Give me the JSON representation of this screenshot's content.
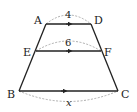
{
  "diagram": {
    "type": "trapezoid-with-parallel-segments",
    "points": {
      "A": {
        "label": "A",
        "x": 46,
        "y": 24
      },
      "D": {
        "label": "D",
        "x": 91,
        "y": 24
      },
      "E": {
        "label": "E",
        "x": 36,
        "y": 51
      },
      "F": {
        "label": "F",
        "x": 101,
        "y": 51
      },
      "B": {
        "label": "B",
        "x": 19,
        "y": 91
      },
      "C": {
        "label": "C",
        "x": 118,
        "y": 91
      }
    },
    "segments": [
      {
        "name": "AD",
        "length_label": "4",
        "arc": "above"
      },
      {
        "name": "EF",
        "length_label": "6",
        "arc": "above"
      },
      {
        "name": "BC",
        "length_label": "x",
        "arc": "below"
      }
    ],
    "parallel_marks": "single arrow on AD, EF, BC",
    "colors": {
      "line": "#222222",
      "arc": "#999999"
    }
  }
}
